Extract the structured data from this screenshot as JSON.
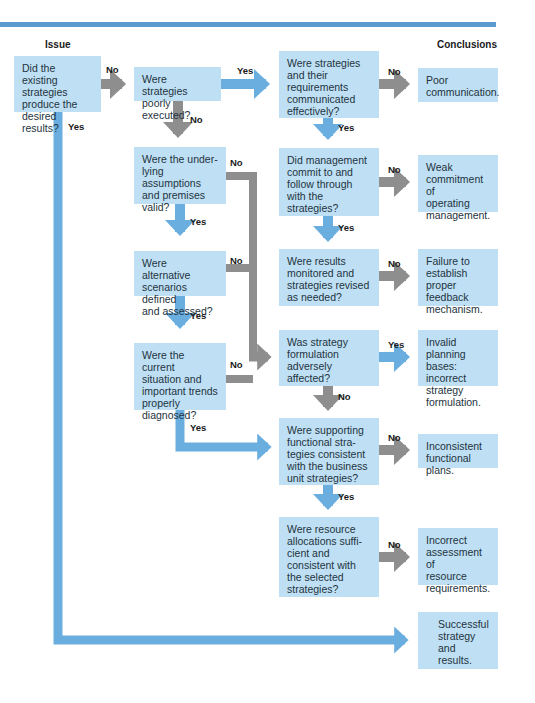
{
  "headers": {
    "issue": "Issue",
    "conclusions": "Conclusions"
  },
  "colors": {
    "box_fill": "#bfe0f4",
    "yes_arrow": "#6aaee0",
    "no_arrow": "#8e8e8e",
    "top_bar": "#5b9bd0"
  },
  "questions": [
    {
      "id": "q1",
      "text": "Did the existing\nstrategies\nproduce the\ndesired results?"
    },
    {
      "id": "q2",
      "text": "Were strategies\npoorly executed?"
    },
    {
      "id": "q3",
      "text": "Were strategies\nand their\nrequirements\ncommunicated\neffectively?"
    },
    {
      "id": "q4",
      "text": "Did management\ncommit to and\nfollow through\nwith the\nstrategies?"
    },
    {
      "id": "q5",
      "text": "Were results\nmonitored and\nstrategies revised\nas needed?"
    },
    {
      "id": "q6",
      "text": "Were the under-\nlying assumptions\nand premises\nvalid?"
    },
    {
      "id": "q7",
      "text": "Were alternative\nscenarios defined\nand assessed?"
    },
    {
      "id": "q8",
      "text": "Were the current\nsituation and\nimportant trends\nproperly\ndiagnosed?"
    },
    {
      "id": "q9",
      "text": "Was strategy\nformulation\nadversely\naffected?"
    },
    {
      "id": "q10",
      "text": "Were supporting\nfunctional stra-\ntegies consistent\nwith the business\nunit strategies?"
    },
    {
      "id": "q11",
      "text": "Were resource\nallocations suffi-\ncient and\nconsistent with\nthe selected\nstrategies?"
    }
  ],
  "conclusions": [
    {
      "id": "c1",
      "text": "Poor\ncommunication."
    },
    {
      "id": "c2",
      "text": "Weak\ncommitment of\noperating\nmanagement."
    },
    {
      "id": "c3",
      "text": "Failure to\nestablish\nproper feedback\nmechanism."
    },
    {
      "id": "c4",
      "text": "Invalid planning\nbases: incorrect\nstrategy\nformulation."
    },
    {
      "id": "c5",
      "text": "Inconsistent\nfunctional plans."
    },
    {
      "id": "c6",
      "text": "Incorrect\nassessment of\nresource\nrequirements."
    },
    {
      "id": "c7",
      "text": "Successful\nstrategy\nand results."
    }
  ],
  "edge_labels": {
    "q1_no": "No",
    "q1_yes": "Yes",
    "q2_yes": "Yes",
    "q2_no": "No",
    "q3_no": "No",
    "q3_yes": "Yes",
    "q4_no": "No",
    "q4_yes": "Yes",
    "q5_no": "No",
    "q6_no": "No",
    "q6_yes": "Yes",
    "q7_no": "No",
    "q7_yes": "Yes",
    "q8_no": "No",
    "q8_yes": "Yes",
    "q9_yes": "Yes",
    "q9_no": "No",
    "q10_no": "No",
    "q10_yes": "Yes",
    "q11_no": "No"
  }
}
